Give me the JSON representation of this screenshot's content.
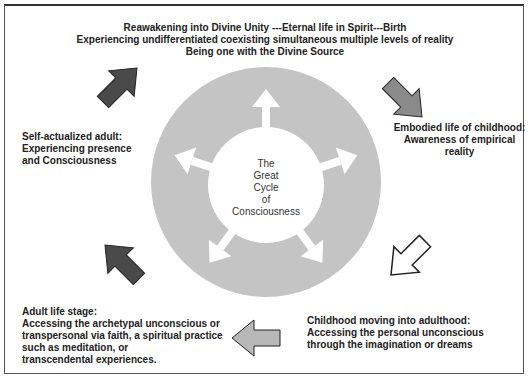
{
  "diagram": {
    "title": "The Great Cycle of Consciousness",
    "center_lines": [
      "The",
      "Great",
      "Cycle",
      "of",
      "Consciousness"
    ],
    "stages": {
      "top": {
        "lines": [
          "Reawakening  into Divine Unity  ---Eternal life in Spirit---Birth",
          "Experiencing undifferentiated coexisting simultaneous multiple levels of reality",
          "Being one with  the Divine Source"
        ]
      },
      "right": {
        "lines": [
          "Embodied life of childhood:",
          "Awareness of empirical reality"
        ]
      },
      "bottom_right": {
        "lines": [
          "Childhood moving into adulthood:",
          "Accessing the personal unconscious",
          "through the imagination or dreams"
        ]
      },
      "bottom_left": {
        "lines": [
          "Adult life stage:",
          "Accessing the archetypal unconscious or",
          "transpersonal via faith, a spiritual practice",
          "such as meditation, or",
          "transcendental experiences."
        ]
      },
      "left": {
        "lines": [
          "Self-actualized adult:",
          "Experiencing presence",
          "and Consciousness"
        ]
      }
    },
    "colors": {
      "ring": "#c4c4c4",
      "dark_arrow": "#4a4a4a",
      "mid_arrow": "#8a8a8a",
      "light_arrow": "#b8b8b8",
      "white_arrow": "#ffffff",
      "text": "#222222"
    }
  }
}
